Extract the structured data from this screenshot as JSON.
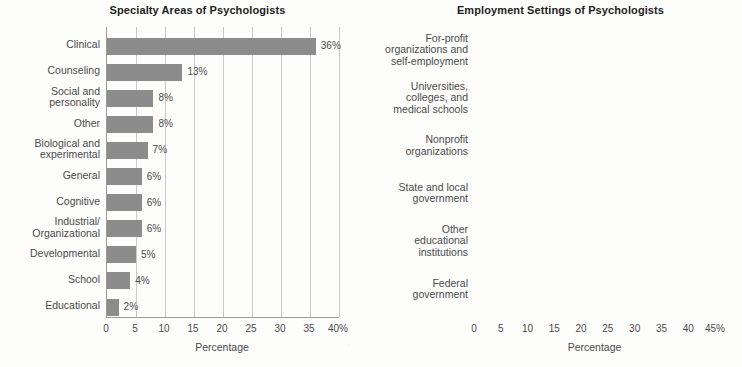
{
  "chart_data": [
    {
      "type": "bar",
      "orientation": "horizontal",
      "title": "Specialty Areas of Psychologists",
      "xlabel": "Percentage",
      "ylabel": "",
      "xlim": [
        0,
        40
      ],
      "xticks": [
        0,
        5,
        10,
        15,
        20,
        25,
        30,
        35,
        40
      ],
      "xtick_labels": [
        "0",
        "5",
        "10",
        "15",
        "20",
        "25",
        "30",
        "35",
        "40%"
      ],
      "grid": true,
      "legend": "none",
      "bar_color": "#8c8c8c",
      "categories": [
        "Clinical",
        "Counseling",
        "Social and\npersonality",
        "Other",
        "Biological and\nexperimental",
        "General",
        "Cognitive",
        "Industrial/\nOrganizational",
        "Developmental",
        "School",
        "Educational"
      ],
      "values": [
        36,
        13,
        8,
        8,
        7,
        6,
        6,
        6,
        5,
        4,
        2
      ],
      "value_labels": [
        "36%",
        "13%",
        "8%",
        "8%",
        "7%",
        "6%",
        "6%",
        "6%",
        "5%",
        "4%",
        "2%"
      ]
    },
    {
      "type": "bar",
      "orientation": "horizontal",
      "title": "Employment Settings of Psychologists",
      "xlabel": "Percentage",
      "ylabel": "",
      "xlim": [
        0,
        45
      ],
      "xticks": [
        0,
        5,
        10,
        15,
        20,
        25,
        30,
        35,
        40,
        45
      ],
      "xtick_labels": [
        "0",
        "5",
        "10",
        "15",
        "20",
        "25",
        "30",
        "35",
        "40",
        "45%"
      ],
      "grid": true,
      "legend": "none",
      "bar_color": "#cccccc",
      "categories": [
        "For-profit\norganizations and\nself-employment",
        "Universities,\ncolleges, and\nmedical schools",
        "Nonprofit\norganizations",
        "State and local\ngovernment",
        "Other\neducational\ninstitutions",
        "Federal\ngovernment"
      ],
      "values": [
        41,
        35,
        8,
        7,
        6,
        3
      ],
      "value_labels": [
        "41%",
        "35%",
        "8%",
        "7%",
        "6%",
        "3%"
      ]
    }
  ]
}
